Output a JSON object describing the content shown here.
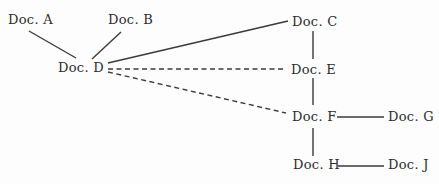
{
  "diagram": {
    "colors": {
      "background": "#fdfdfd",
      "ink": "#2d2d2d",
      "line": "#3a3a3a"
    },
    "nodes": [
      {
        "id": "doc-a",
        "label": "Doc. A",
        "x": 8,
        "y": 13
      },
      {
        "id": "doc-b",
        "label": "Doc. B",
        "x": 108,
        "y": 13
      },
      {
        "id": "doc-c",
        "label": "Doc. C",
        "x": 292,
        "y": 15
      },
      {
        "id": "doc-d",
        "label": "Doc. D",
        "x": 58,
        "y": 61
      },
      {
        "id": "doc-e",
        "label": "Doc. E",
        "x": 291,
        "y": 63
      },
      {
        "id": "doc-f",
        "label": "Doc. F",
        "x": 292,
        "y": 110
      },
      {
        "id": "doc-g",
        "label": "Doc. G",
        "x": 388,
        "y": 110
      },
      {
        "id": "doc-h",
        "label": "Doc. H",
        "x": 293,
        "y": 158
      },
      {
        "id": "doc-j",
        "label": "Doc. J",
        "x": 388,
        "y": 158
      }
    ],
    "edges": [
      {
        "from": "doc-a",
        "to": "doc-d",
        "style": "solid",
        "x1": 29,
        "y1": 31,
        "x2": 76,
        "y2": 58
      },
      {
        "from": "doc-b",
        "to": "doc-d",
        "style": "solid",
        "x1": 121,
        "y1": 32,
        "x2": 92,
        "y2": 59
      },
      {
        "from": "doc-d",
        "to": "doc-c",
        "style": "solid",
        "x1": 108,
        "y1": 63,
        "x2": 288,
        "y2": 21
      },
      {
        "from": "doc-d",
        "to": "doc-e",
        "style": "dashed",
        "x1": 108,
        "y1": 69,
        "x2": 286,
        "y2": 69
      },
      {
        "from": "doc-d",
        "to": "doc-f",
        "style": "dashed",
        "x1": 108,
        "y1": 72,
        "x2": 286,
        "y2": 113
      },
      {
        "from": "doc-c",
        "to": "doc-e",
        "style": "solid",
        "x1": 313,
        "y1": 31,
        "x2": 313,
        "y2": 59
      },
      {
        "from": "doc-e",
        "to": "doc-f",
        "style": "solid",
        "x1": 313,
        "y1": 78,
        "x2": 313,
        "y2": 105
      },
      {
        "from": "doc-f",
        "to": "doc-g",
        "style": "solid",
        "x1": 337,
        "y1": 117,
        "x2": 384,
        "y2": 117
      },
      {
        "from": "doc-f",
        "to": "doc-h",
        "style": "solid",
        "x1": 313,
        "y1": 128,
        "x2": 313,
        "y2": 156
      },
      {
        "from": "doc-h",
        "to": "doc-j",
        "style": "solid",
        "x1": 338,
        "y1": 166,
        "x2": 384,
        "y2": 166
      }
    ]
  }
}
